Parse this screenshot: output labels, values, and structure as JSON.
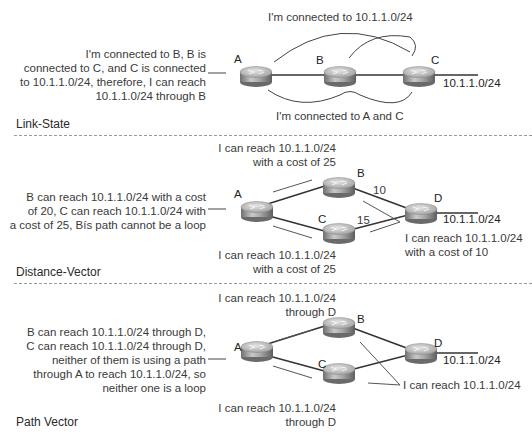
{
  "panels": [
    {
      "id": "link-state",
      "title": "Link-State",
      "description": [
        "I'm connected to B, B is",
        "connected to C, and C is connected",
        "to 10.1.1.0/24, therefore, I can reach",
        "10.1.1.0/24 through B"
      ],
      "routers": [
        {
          "name": "A",
          "label": "A"
        },
        {
          "name": "B",
          "label": "B"
        },
        {
          "name": "C",
          "label": "C"
        }
      ],
      "network": "10.1.1.0/24",
      "annotations": {
        "top": "I'm connected to 10.1.1.0/24",
        "bottom": "I'm connected to A and C"
      }
    },
    {
      "id": "distance-vector",
      "title": "Distance-Vector",
      "description": [
        "B can reach 10.1.1.0/24 with a cost",
        "of 20, C can reach 10.1.1.0/24 with",
        "a cost of 25, Bís path cannot be a loop"
      ],
      "routers": [
        {
          "name": "A",
          "label": "A"
        },
        {
          "name": "B",
          "label": "B"
        },
        {
          "name": "C",
          "label": "C"
        },
        {
          "name": "D",
          "label": "D"
        }
      ],
      "network": "10.1.1.0/24",
      "link_costs": {
        "B-D": "10",
        "C-D": "15"
      },
      "annotations": {
        "top": [
          "I can reach 10.1.1.0/24",
          "with a cost of 25"
        ],
        "bottom": [
          "I can reach 10.1.1.0/24",
          "with a cost of 25"
        ],
        "right": [
          "I can reach 10.1.1.0/24",
          "with a cost of 10"
        ]
      }
    },
    {
      "id": "path-vector",
      "title": "Path Vector",
      "description": [
        "B can reach 10.1.1.0/24 through D,",
        "C can reach 10.1.1.0/24 through D,",
        "neither of them is using a path",
        "through A to reach 10.1.1.0/24, so",
        "neither one is a loop"
      ],
      "routers": [
        {
          "name": "A",
          "label": "A"
        },
        {
          "name": "B",
          "label": "B"
        },
        {
          "name": "C",
          "label": "C"
        },
        {
          "name": "D",
          "label": "D"
        }
      ],
      "network": "10.1.1.0/24",
      "annotations": {
        "top": [
          "I can reach 10.1.1.0/24",
          "through D"
        ],
        "bottom": [
          "I can reach 10.1.1.0/24",
          "through D"
        ],
        "right": "I can reach 10.1.1.0/24"
      }
    }
  ]
}
